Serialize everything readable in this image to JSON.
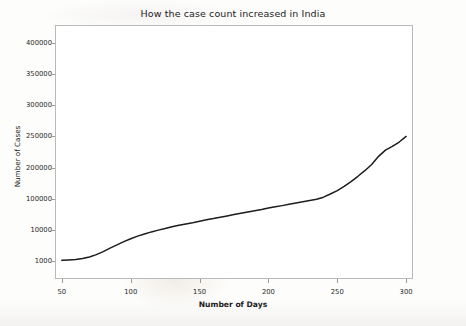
{
  "chart_data": {
    "type": "line",
    "title": "How the case count increased in India",
    "xlabel": "Number of Days",
    "ylabel": "Number of Cases",
    "grid": false,
    "legend": false,
    "yscale": "log-like (evenly spaced decade-then-linear ticks)",
    "xlim": [
      45,
      305
    ],
    "xticks": [
      50,
      100,
      150,
      200,
      250,
      300
    ],
    "xticklabels": [
      "50",
      "100",
      "150",
      "200",
      "250",
      "300"
    ],
    "yticks": [
      1000,
      10000,
      100000,
      200000,
      250000,
      300000,
      350000,
      400000
    ],
    "yticklabels": [
      "1000",
      "10000",
      "100000",
      "200000",
      "250000",
      "300000",
      "350000",
      "400000"
    ],
    "series": [
      {
        "name": "Cumulative cases",
        "color": "#1c1c1c",
        "x": [
          50,
          55,
          60,
          65,
          70,
          75,
          80,
          85,
          90,
          95,
          100,
          105,
          110,
          115,
          120,
          125,
          130,
          135,
          140,
          145,
          150,
          155,
          160,
          165,
          170,
          175,
          180,
          185,
          190,
          195,
          200,
          205,
          210,
          215,
          220,
          225,
          230,
          235,
          240,
          245,
          250,
          255,
          260,
          265,
          270,
          275,
          280,
          285,
          290,
          295,
          300
        ],
        "y": [
          1050,
          1080,
          1120,
          1200,
          1350,
          1600,
          2000,
          2600,
          3300,
          4200,
          5200,
          6300,
          7400,
          8600,
          9800,
          11000,
          12500,
          14000,
          15500,
          17000,
          19000,
          21000,
          23000,
          25500,
          28000,
          31000,
          34000,
          37500,
          41000,
          45000,
          50000,
          55000,
          60000,
          66000,
          73000,
          80000,
          88000,
          96000,
          105000,
          115000,
          126000,
          140000,
          155000,
          172000,
          190000,
          205000,
          218000,
          228000,
          234000,
          241000,
          250000
        ]
      }
    ]
  }
}
